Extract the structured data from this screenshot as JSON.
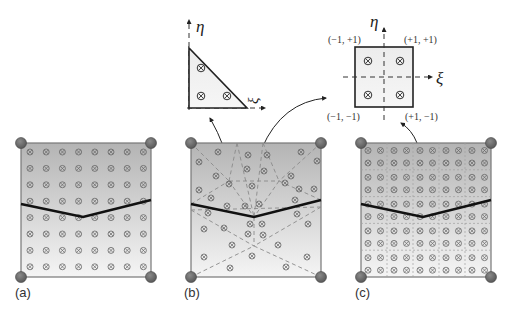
{
  "figure": {
    "panels": [
      {
        "id": "a",
        "label": "(a)",
        "description": "Standard 8x8 Gauss quadrature over cracked element"
      },
      {
        "id": "b",
        "label": "(b)",
        "description": "Sub-triangulation conforming to crack with 3-point triangle rule"
      },
      {
        "id": "c",
        "label": "(c)",
        "description": "5x5 sub-quadrilaterals each with 2x2 Gauss points"
      }
    ],
    "reference_triangle": {
      "axis_eta": "η",
      "axis_xi": "ξ",
      "gauss_points": 3
    },
    "reference_square": {
      "axis_eta": "η",
      "axis_xi": "ξ",
      "corners": {
        "top_left": "(−1, +1)",
        "top_right": "(+1, +1)",
        "bottom_left": "(−1, −1)",
        "bottom_right": "(+1, −1)"
      },
      "gauss_points": 4
    },
    "colors": {
      "element_fill_top": "#b8b8b8",
      "element_fill_bottom": "#f4f4f4",
      "node": "#6a6a6a",
      "crack": "#111111",
      "dashed": "#8a8a8a"
    }
  }
}
